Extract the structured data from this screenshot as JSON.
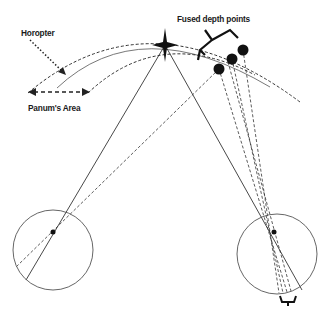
{
  "labels": {
    "horopter": "Horopter",
    "fused_depth_points": "Fused depth points",
    "panums_area": "Panum's Area"
  },
  "colors": {
    "line": "#333333",
    "thin_line": "#555555",
    "dot": "#111111"
  },
  "elements": {
    "fixation_point": "star-icon",
    "left_eye": "eye-circle",
    "right_eye": "eye-circle",
    "fused_points_count": 3
  }
}
